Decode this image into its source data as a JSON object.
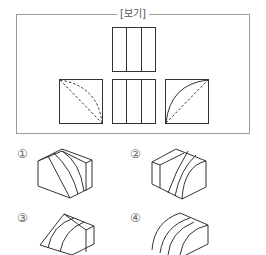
{
  "question": {
    "bogi_label": "[보기]",
    "views": [
      {
        "name": "top-view",
        "description": "square with two vertical lines (3 strips)"
      },
      {
        "name": "left-side-view",
        "description": "square with two dashed curves from top-left to bottom-right"
      },
      {
        "name": "front-view",
        "description": "square with two vertical lines (3 strips)"
      },
      {
        "name": "right-side-view",
        "description": "square with solid quarter-arc and dashed diagonal"
      }
    ]
  },
  "options": [
    {
      "number": "①",
      "shape": "box with curved diagonal grooves on front face"
    },
    {
      "number": "②",
      "shape": "box with cylindrical cut on right portion"
    },
    {
      "number": "③",
      "shape": "wedge with curved grooves"
    },
    {
      "number": "④",
      "shape": "quarter-cylinder block with grooves"
    }
  ],
  "colors": {
    "line": "#333333",
    "frame": "#9a9a9a",
    "text": "#555555"
  }
}
